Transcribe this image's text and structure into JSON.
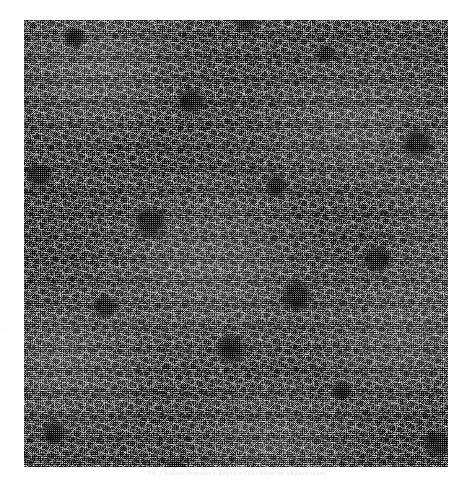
{
  "document": {
    "kind": "scanned-paper-figure",
    "page_background": "#ffffff"
  },
  "figure": {
    "name": "large-scale-structure-slice",
    "panel": {
      "x": 24,
      "y": 20,
      "width": 424,
      "height": 447,
      "background_color": "#111111",
      "foreground_color": "#ffffff",
      "rendering": "halftone-scan"
    },
    "caption": "Fig. 1. Projected distribution of particles in a slice through the simulation volume.",
    "caption_legible": false
  },
  "chart_data": {
    "type": "scatter",
    "title": "",
    "xlabel": "",
    "ylabel": "",
    "grid": false,
    "legend": "none",
    "xlim": [
      0,
      1
    ],
    "ylim": [
      0,
      1
    ],
    "point_color": "#ffffff",
    "background_color": "#111111"
  }
}
